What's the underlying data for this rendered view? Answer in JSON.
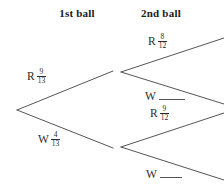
{
  "diagram": {
    "title_hidden": "Probability tree diagram for drawing two balls",
    "headers": {
      "first": "1st ball",
      "second": "2nd ball"
    },
    "line_color": "#555555",
    "text_color": "#2b2b2b",
    "background": "#ffffff"
  },
  "branches": {
    "first_ball": [
      {
        "outcome": "R",
        "numerator": "9",
        "denominator": "13",
        "blank": false
      },
      {
        "outcome": "W",
        "numerator": "4",
        "denominator": "13",
        "blank": false
      }
    ],
    "second_ball": [
      {
        "outcome": "R",
        "numerator": "8",
        "denominator": "12",
        "blank": false
      },
      {
        "outcome": "W",
        "numerator": "",
        "denominator": "",
        "blank": true
      },
      {
        "outcome": "R",
        "numerator": "9",
        "denominator": "12",
        "blank": false
      },
      {
        "outcome": "W",
        "numerator": "",
        "denominator": "",
        "blank": true
      }
    ]
  }
}
